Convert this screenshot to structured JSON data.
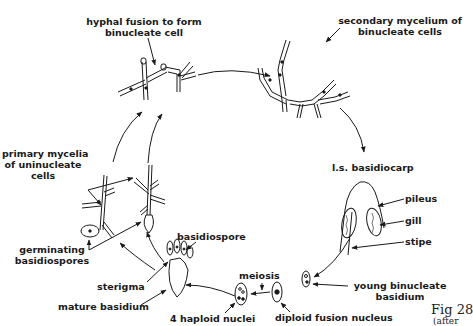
{
  "diagram": {
    "type": "life-cycle",
    "labels": {
      "hyphal_fusion": [
        "hyphal fusion to form",
        "binucleate cell"
      ],
      "secondary_mycelium": [
        "secondary mycelium of",
        "binucleate cells"
      ],
      "basidiocarp": "l.s. basidiocarp",
      "pileus": "pileus",
      "gill": "gill",
      "stipe": "stipe",
      "young_basidium": [
        "young binucleate",
        "basidium"
      ],
      "diploid_fusion_nucleus": "diploid fusion nucleus",
      "meiosis": "meiosis",
      "haploid_nuclei": "4 haploid nuclei",
      "mature_basidium": "mature basidium",
      "sterigma": "sterigma",
      "basidiospore": "basidiospore",
      "germinating": [
        "germinating",
        "basidiospores"
      ],
      "primary_mycelia": [
        "primary mycelia",
        "of uninucleate",
        "cells"
      ]
    },
    "caption": {
      "line1": "Fig 28",
      "line2": "(after"
    },
    "cycle_order": [
      "mature basidium",
      "basidiospore",
      "germinating basidiospores",
      "primary mycelia of uninucleate cells",
      "hyphal fusion to form binucleate cell",
      "secondary mycelium of binucleate cells",
      "l.s. basidiocarp",
      "young binucleate basidium",
      "diploid fusion nucleus",
      "meiosis",
      "4 haploid nuclei",
      "mature basidium"
    ],
    "colors": {
      "ink": "#1a1a1a",
      "background": "#ffffff"
    }
  }
}
